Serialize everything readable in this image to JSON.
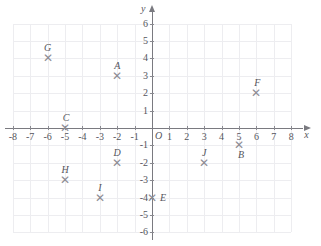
{
  "chart_data": {
    "type": "scatter",
    "title": "",
    "xlabel": "x",
    "ylabel": "y",
    "xlim": [
      -8,
      8
    ],
    "ylim": [
      -6,
      6
    ],
    "grid": true,
    "legend": "none",
    "x_ticks": [
      -8,
      -7,
      -6,
      -5,
      -4,
      -3,
      -2,
      -1,
      1,
      2,
      3,
      4,
      5,
      6,
      7,
      8
    ],
    "y_ticks": [
      6,
      5,
      4,
      3,
      2,
      1,
      -1,
      -2,
      -3,
      -4,
      -5,
      -6
    ],
    "x_tick_labels": [
      "-8",
      "-7",
      "-6",
      "-5",
      "-4",
      "-3",
      "-2",
      "-1",
      "1",
      "2",
      "3",
      "4",
      "5",
      "6",
      "7",
      "8"
    ],
    "y_tick_labels": [
      "6",
      "5",
      "4",
      "3",
      "2",
      "1",
      "-1",
      "-2",
      "-3",
      "-4",
      "-5",
      "-6"
    ],
    "origin_label": "O",
    "marker_glyph": "✕",
    "points": [
      {
        "label": "A",
        "x": -2,
        "y": 3,
        "label_dx": 0,
        "label_dy": -10
      },
      {
        "label": "B",
        "x": 5,
        "y": -1,
        "label_dx": 2,
        "label_dy": 10
      },
      {
        "label": "C",
        "x": -5,
        "y": 0,
        "label_dx": 1,
        "label_dy": -10
      },
      {
        "label": "D",
        "x": -2,
        "y": -2,
        "label_dx": 0,
        "label_dy": -10
      },
      {
        "label": "E",
        "x": 0,
        "y": -4,
        "label_dx": 11,
        "label_dy": 0
      },
      {
        "label": "F",
        "x": 6,
        "y": 2,
        "label_dx": 1,
        "label_dy": -10
      },
      {
        "label": "G",
        "x": -6,
        "y": 4,
        "label_dx": 0,
        "label_dy": -10
      },
      {
        "label": "H",
        "x": -5,
        "y": -3,
        "label_dx": 0,
        "label_dy": -10
      },
      {
        "label": "I",
        "x": -3,
        "y": -4,
        "label_dx": 0,
        "label_dy": -10
      },
      {
        "label": "J",
        "x": 3,
        "y": -2,
        "label_dx": 0,
        "label_dy": -10
      }
    ]
  },
  "geometry": {
    "origin_x": 152,
    "origin_y": 128,
    "unit": 17.4,
    "grid_min_x": -8,
    "grid_max_x": 8,
    "grid_min_y": -6,
    "grid_max_y": 6
  },
  "colors": {
    "grid": "#ededf0",
    "axis": "#7a7a80",
    "text": "#55555c",
    "marker": "#8c8c92",
    "background": "#ffffff"
  }
}
